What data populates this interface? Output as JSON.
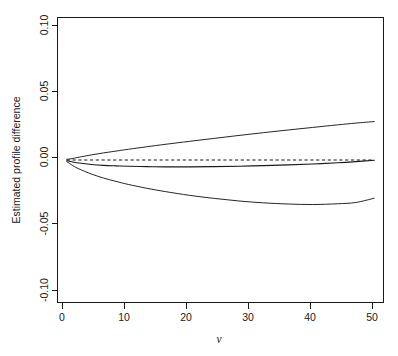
{
  "figure": {
    "kind": "statistical-line-plot",
    "background_color": "#ffffff",
    "foreground_color": "#1a1a1a"
  },
  "axes": {
    "x_title": "v",
    "y_title": "Estimated profile difference",
    "x_tick_labels": [
      "0",
      "10",
      "20",
      "30",
      "40",
      "50"
    ],
    "y_tick_labels": [
      "0.10",
      "0.05",
      "0.00",
      "-0.05",
      "-0.10"
    ]
  },
  "chart_data": {
    "type": "line",
    "title": "",
    "subtitle": "",
    "xlabel": "v",
    "ylabel": "Estimated profile difference",
    "xlim": [
      -1.5,
      51.5
    ],
    "ylim": [
      -0.112,
      0.112
    ],
    "xticks": [
      0,
      10,
      20,
      30,
      40,
      50
    ],
    "yticks": [
      0.1,
      0.05,
      0.0,
      -0.05,
      -0.1
    ],
    "xticklabels": [
      "0",
      "10",
      "20",
      "30",
      "40",
      "50"
    ],
    "yticklabels": [
      "0.10",
      "0.05",
      "0.00",
      "-0.05",
      "-0.10"
    ],
    "grid": false,
    "legend": null,
    "legend_position": "none",
    "box": true,
    "series": [
      {
        "name": "upper confidence band",
        "style": "solid",
        "color": "#1a1a1a",
        "x": [
          0,
          1,
          2,
          4,
          6,
          8,
          10,
          13,
          16,
          20,
          24,
          28,
          32,
          36,
          40,
          44,
          47,
          50
        ],
        "values": [
          0.0005,
          0.0012,
          0.0022,
          0.004,
          0.0056,
          0.007,
          0.0084,
          0.0104,
          0.0123,
          0.0147,
          0.017,
          0.0193,
          0.0215,
          0.0236,
          0.0256,
          0.0276,
          0.029,
          0.0302
        ]
      },
      {
        "name": "estimated profile difference",
        "style": "solid",
        "color": "#1a1a1a",
        "x": [
          0,
          1,
          2,
          4,
          6,
          8,
          10,
          13,
          16,
          20,
          24,
          28,
          32,
          36,
          40,
          44,
          47,
          50
        ],
        "values": [
          -0.0006,
          -0.0016,
          -0.0024,
          -0.0035,
          -0.0042,
          -0.0046,
          -0.0049,
          -0.0052,
          -0.0054,
          -0.0054,
          -0.0052,
          -0.0049,
          -0.0044,
          -0.0038,
          -0.0031,
          -0.0022,
          -0.0013,
          -0.0002
        ]
      },
      {
        "name": "lower confidence band",
        "style": "solid",
        "color": "#1a1a1a",
        "x": [
          0,
          1,
          2,
          4,
          6,
          8,
          10,
          13,
          16,
          20,
          24,
          28,
          32,
          36,
          40,
          44,
          47,
          50
        ],
        "values": [
          -0.0012,
          -0.0044,
          -0.007,
          -0.011,
          -0.0142,
          -0.0168,
          -0.0192,
          -0.0222,
          -0.0248,
          -0.0278,
          -0.0302,
          -0.0322,
          -0.0337,
          -0.0346,
          -0.035,
          -0.0344,
          -0.0334,
          -0.03
        ]
      },
      {
        "name": "zero reference line",
        "style": "dashed",
        "color": "#1a1a1a",
        "x": [
          0,
          50
        ],
        "values": [
          0.0,
          0.0
        ]
      }
    ]
  }
}
